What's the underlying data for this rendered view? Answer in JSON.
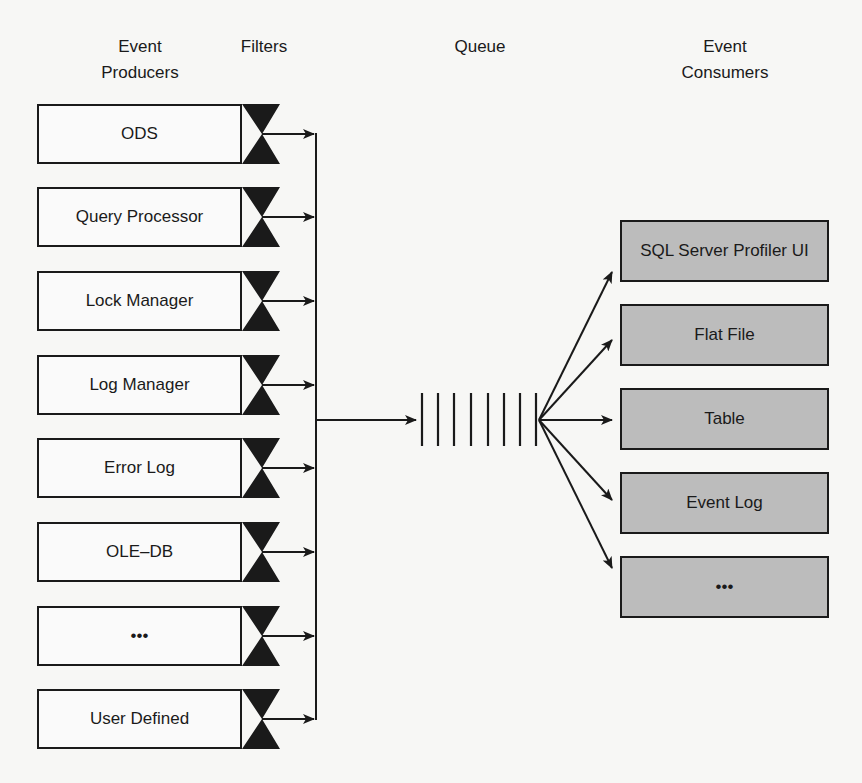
{
  "headers": {
    "producers_line1": "Event",
    "producers_line2": "Producers",
    "filters": "Filters",
    "queue": "Queue",
    "consumers_line1": "Event",
    "consumers_line2": "Consumers"
  },
  "producers": [
    {
      "label": "ODS"
    },
    {
      "label": "Query Processor"
    },
    {
      "label": "Lock Manager"
    },
    {
      "label": "Log Manager"
    },
    {
      "label": "Error Log"
    },
    {
      "label": "OLE–DB"
    },
    {
      "label": "•••"
    },
    {
      "label": "User Defined"
    }
  ],
  "queue": {
    "slots": 8
  },
  "consumers": [
    {
      "label": "SQL Server Profiler UI"
    },
    {
      "label": "Flat File"
    },
    {
      "label": "Table"
    },
    {
      "label": "Event Log"
    },
    {
      "label": "•••"
    }
  ],
  "colors": {
    "background": "#f7f7f5",
    "producer_fill": "#fafafa",
    "consumer_fill": "#bcbcbc",
    "stroke": "#1a1a1a"
  }
}
